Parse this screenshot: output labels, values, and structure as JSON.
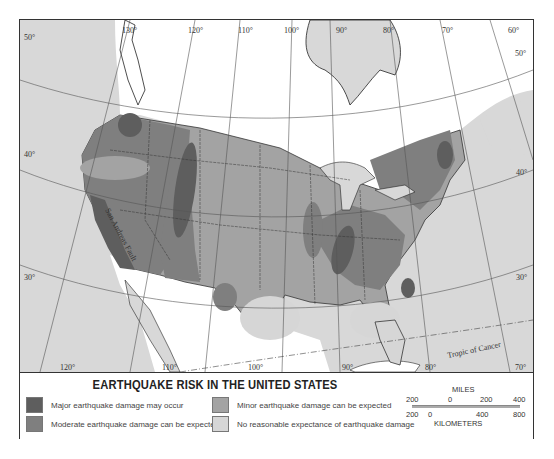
{
  "map": {
    "title": "EARTHQUAKE RISK IN THE UNITED STATES",
    "annotations": {
      "fault_label": "San Andreas Fault",
      "tropic_label": "Tropic of Cancer"
    },
    "longitude_labels_top": [
      "130°",
      "120°",
      "110°",
      "100°",
      "90°",
      "80°",
      "70°",
      "60°"
    ],
    "longitude_labels_bottom": [
      "120°",
      "110°",
      "100°",
      "90°",
      "80°",
      "70°"
    ],
    "latitude_labels_left": [
      "50°",
      "40°",
      "30°"
    ],
    "latitude_labels_right": [
      "50°",
      "40°",
      "30°"
    ],
    "colors": {
      "major": "#5e5e5e",
      "moderate": "#7f7f7f",
      "minor": "#a3a3a3",
      "none": "#d6d6d6",
      "ocean": "#d8d8d8",
      "foreign_land": "#ffffff",
      "lakes": "#d8d8d8"
    }
  },
  "legend": {
    "items": [
      {
        "label": "Major earthquake damage may occur",
        "color": "#5e5e5e"
      },
      {
        "label": "Moderate earthquake damage can be expected",
        "color": "#7f7f7f"
      },
      {
        "label": "Minor earthquake damage can be expected",
        "color": "#a3a3a3"
      },
      {
        "label": "No reasonable expectance of earthquake damage",
        "color": "#d6d6d6"
      }
    ]
  },
  "scale": {
    "miles_label": "MILES",
    "miles_ticks": [
      "200",
      "0",
      "200",
      "400"
    ],
    "km_ticks": [
      "200",
      "0",
      "400",
      "800"
    ],
    "km_label": "KILOMETERS"
  }
}
